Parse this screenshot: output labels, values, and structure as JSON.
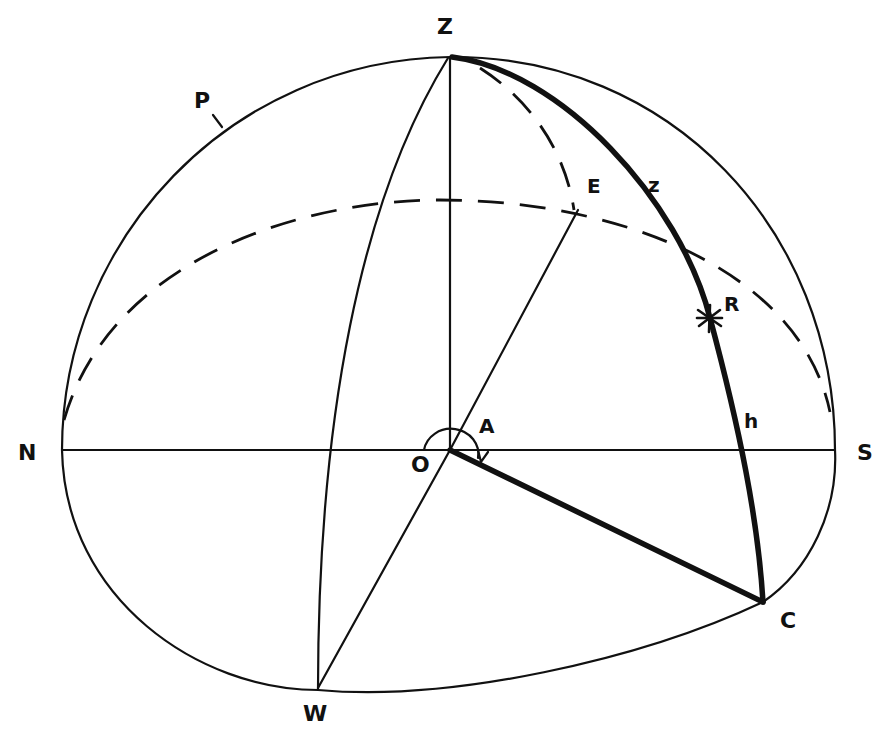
{
  "diagram": {
    "type": "celestial-sphere-horizon-coordinates",
    "labels": {
      "zenith": "Z",
      "north": "N",
      "south": "S",
      "east": "E",
      "west": "W",
      "origin": "O",
      "azimuth": "A",
      "star": "R",
      "zenith_distance": "z",
      "altitude": "h",
      "foot_point": "C",
      "pole_arc": "P"
    },
    "colors": {
      "ink": "#111111",
      "background": "#ffffff"
    }
  }
}
